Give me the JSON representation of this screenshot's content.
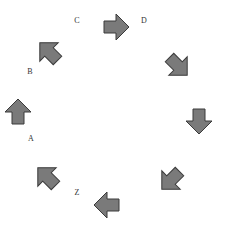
{
  "diagram": {
    "type": "circular-arrow-sequence",
    "background": "#ffffff",
    "arrow_fill": "#7a7a7a",
    "arrow_stroke": "#3a3a3a",
    "labels": [
      {
        "id": "C",
        "text": "C",
        "x": 77,
        "y": 21
      },
      {
        "id": "D",
        "text": "D",
        "x": 144,
        "y": 21
      },
      {
        "id": "B",
        "text": "B",
        "x": 30,
        "y": 72
      },
      {
        "id": "A",
        "text": "A",
        "x": 31,
        "y": 139
      },
      {
        "id": "Z",
        "text": "Z",
        "x": 77,
        "y": 193
      }
    ],
    "arrows": [
      {
        "x": 18,
        "y": 112,
        "direction": "up",
        "angle": 0
      },
      {
        "x": 49,
        "y": 52,
        "direction": "up-left",
        "angle": -45
      },
      {
        "x": 116,
        "y": 27,
        "direction": "right",
        "angle": 90
      },
      {
        "x": 178,
        "y": 66,
        "direction": "down-right",
        "angle": 135
      },
      {
        "x": 199,
        "y": 121,
        "direction": "down",
        "angle": 180
      },
      {
        "x": 171,
        "y": 180,
        "direction": "down-left",
        "angle": 225
      },
      {
        "x": 107,
        "y": 205,
        "direction": "left",
        "angle": 270
      },
      {
        "x": 47,
        "y": 177,
        "direction": "up-left",
        "angle": -45
      }
    ]
  }
}
